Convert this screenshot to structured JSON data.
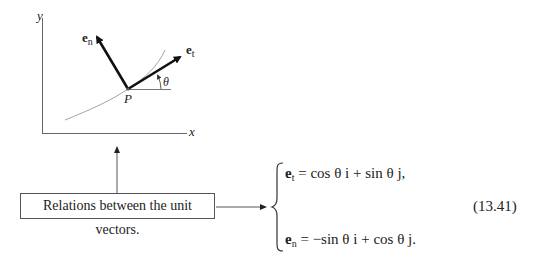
{
  "diagram": {
    "axes": {
      "x_label": "x",
      "y_label": "y"
    },
    "point_label": "P",
    "angle_label": "θ",
    "vectors": [
      {
        "name": "e",
        "subscript": "n"
      },
      {
        "name": "e",
        "subscript": "t"
      }
    ]
  },
  "annotation": {
    "box_text": "Relations between the unit vectors."
  },
  "equations": {
    "row1": {
      "lhs": "e",
      "lhs_sub": "t",
      "rhs": "= cos θ i + sin θ j,"
    },
    "row2": {
      "lhs": "e",
      "lhs_sub": "n",
      "rhs": "= −sin θ i + cos θ j."
    },
    "number": "(13.41)"
  }
}
